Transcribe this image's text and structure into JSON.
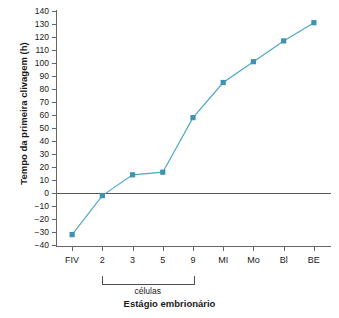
{
  "chart_data": {
    "type": "line",
    "title": "",
    "xlabel": "Estágio embrionário",
    "ylabel": "Tempo da primeira clivagem (h)",
    "categories": [
      "FIV",
      "2",
      "3",
      "5",
      "9",
      "MI",
      "Mo",
      "Bl",
      "BE"
    ],
    "values": [
      -32,
      -2,
      14,
      16,
      58,
      85,
      101,
      117,
      131
    ],
    "series": [
      {
        "name": "Tempo da primeira clivagem",
        "values": [
          -32,
          -2,
          14,
          16,
          58,
          85,
          101,
          117,
          131
        ]
      }
    ],
    "ylim": [
      -40,
      140
    ],
    "yticks": [
      140,
      130,
      120,
      110,
      100,
      90,
      80,
      70,
      60,
      50,
      40,
      30,
      20,
      10,
      0,
      -10,
      -20,
      -30,
      -40
    ],
    "ytick_labels": [
      "140",
      "130",
      "120",
      "110",
      "100",
      "90",
      "80",
      "70",
      "60",
      "50",
      "40",
      "30",
      "20",
      "10",
      "0",
      "−10",
      "−20",
      "−30",
      "−40"
    ],
    "grid": false,
    "legend": "none",
    "zero_line": true,
    "marker": "square",
    "series_color": "#4fa8c4",
    "marker_color": "#3f93b0",
    "axis_color": "#666666",
    "annotations": [
      {
        "type": "bracket",
        "label": "células",
        "from_category": "2",
        "to_category": "9"
      }
    ]
  },
  "axis_titles": {
    "y": "Tempo da primeira clivagem (h)",
    "x": "Estágio embrionário"
  },
  "bracket": {
    "label": "células"
  }
}
